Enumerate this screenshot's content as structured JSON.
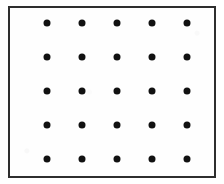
{
  "figure": {
    "kind": "dot-lattice-diagram",
    "canvas": {
      "width": 224,
      "height": 184,
      "background_color": "#ffffff"
    },
    "frame": {
      "left": 8,
      "top": 6,
      "width": 208,
      "height": 172,
      "border_width": 2,
      "border_color": "#2e2e2e",
      "fill_color": "#fefefe"
    },
    "dot_style": {
      "diameter": 7,
      "color": "#111111",
      "shape": "circle"
    },
    "lattice": {
      "columns": 5,
      "rows": 5,
      "total_dots": 25,
      "column_spacing": 35,
      "row_spacing": 34,
      "column_centers_x": [
        46.5,
        81.5,
        116.5,
        151.5,
        186.5
      ],
      "row_centers_y": [
        22.5,
        56.5,
        90.5,
        124.5,
        158.5
      ]
    },
    "dots": [
      {
        "row": 1,
        "col": 1,
        "x": 46.5,
        "y": 22.5
      },
      {
        "row": 1,
        "col": 2,
        "x": 81.5,
        "y": 22.5
      },
      {
        "row": 1,
        "col": 3,
        "x": 116.5,
        "y": 22.5
      },
      {
        "row": 1,
        "col": 4,
        "x": 151.5,
        "y": 22.5
      },
      {
        "row": 1,
        "col": 5,
        "x": 186.5,
        "y": 22.5
      },
      {
        "row": 2,
        "col": 1,
        "x": 46.5,
        "y": 56.5
      },
      {
        "row": 2,
        "col": 2,
        "x": 81.5,
        "y": 56.5
      },
      {
        "row": 2,
        "col": 3,
        "x": 116.5,
        "y": 56.5
      },
      {
        "row": 2,
        "col": 4,
        "x": 151.5,
        "y": 56.5
      },
      {
        "row": 2,
        "col": 5,
        "x": 186.5,
        "y": 56.5
      },
      {
        "row": 3,
        "col": 1,
        "x": 46.5,
        "y": 90.5
      },
      {
        "row": 3,
        "col": 2,
        "x": 81.5,
        "y": 90.5
      },
      {
        "row": 3,
        "col": 3,
        "x": 116.5,
        "y": 90.5
      },
      {
        "row": 3,
        "col": 4,
        "x": 151.5,
        "y": 90.5
      },
      {
        "row": 3,
        "col": 5,
        "x": 186.5,
        "y": 90.5
      },
      {
        "row": 4,
        "col": 1,
        "x": 46.5,
        "y": 124.5
      },
      {
        "row": 4,
        "col": 2,
        "x": 81.5,
        "y": 124.5
      },
      {
        "row": 4,
        "col": 3,
        "x": 116.5,
        "y": 124.5
      },
      {
        "row": 4,
        "col": 4,
        "x": 151.5,
        "y": 124.5
      },
      {
        "row": 4,
        "col": 5,
        "x": 186.5,
        "y": 124.5
      },
      {
        "row": 5,
        "col": 1,
        "x": 46.5,
        "y": 158.5
      },
      {
        "row": 5,
        "col": 2,
        "x": 81.5,
        "y": 158.5
      },
      {
        "row": 5,
        "col": 3,
        "x": 116.5,
        "y": 158.5
      },
      {
        "row": 5,
        "col": 4,
        "x": 151.5,
        "y": 158.5
      },
      {
        "row": 5,
        "col": 5,
        "x": 186.5,
        "y": 158.5
      }
    ]
  }
}
